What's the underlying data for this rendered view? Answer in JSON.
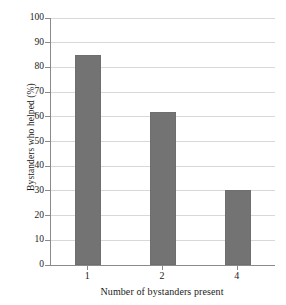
{
  "chart_data": {
    "type": "bar",
    "title": "",
    "subtitle": "",
    "xlabel": "Number of bystanders present",
    "ylabel": "Bystanders who helped (%)",
    "categories": [
      "1",
      "2",
      "4"
    ],
    "values": [
      85,
      62,
      30.5
    ],
    "series": [
      {
        "name": "Bystanders who helped",
        "values": [
          85,
          62,
          30.5
        ]
      }
    ],
    "ylim": [
      0,
      100
    ],
    "ytick_labels": [
      "0",
      "10",
      "20",
      "30",
      "40",
      "50",
      "60",
      "70",
      "80",
      "90",
      "100"
    ],
    "ytick_values": [
      0,
      10,
      20,
      30,
      40,
      50,
      60,
      70,
      80,
      90,
      100
    ],
    "xtick_labels": [
      "1",
      "2",
      "4"
    ],
    "grid": true,
    "grid_axis": "y",
    "legend": false,
    "legend_position": "none",
    "bar_color": "#737373",
    "grid_color": "#d8d8d8",
    "axis_color": "#8a8a8a",
    "background_color": "#ffffff",
    "text_color": "#1a1a1a",
    "annotations": []
  }
}
